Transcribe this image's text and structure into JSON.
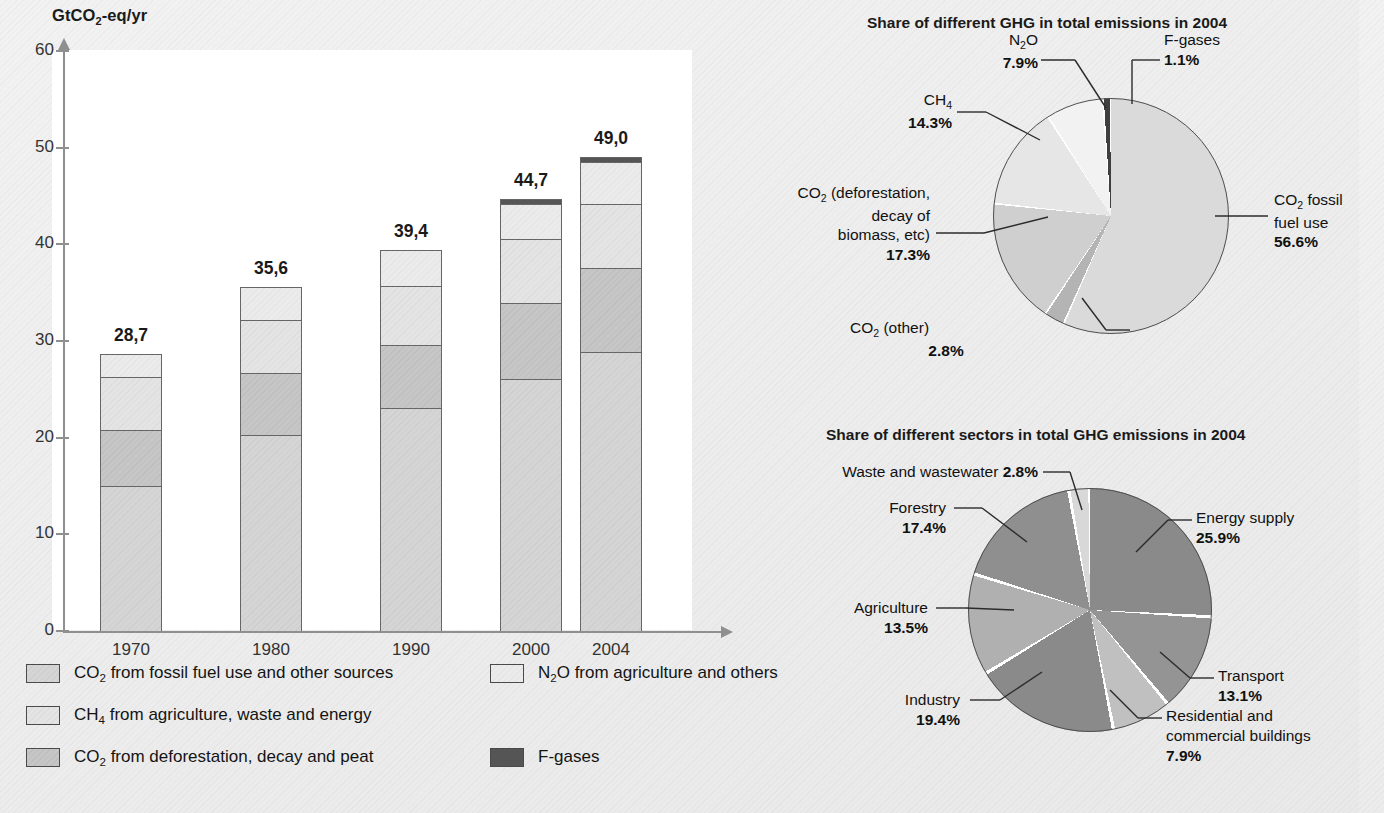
{
  "bar_chart": {
    "y_axis_title": "GtCO2-eq/yr",
    "y_ticks": [
      "0",
      "10",
      "20",
      "30",
      "40",
      "50",
      "60"
    ],
    "x_labels": [
      "1970",
      "1980",
      "1990",
      "2000",
      "2004"
    ],
    "totals": [
      "28,7",
      "35,6",
      "39,4",
      "44,7",
      "49,0"
    ],
    "legend": [
      {
        "label": "CO2 from fossil fuel use and other sources",
        "swatch": "sw-co2fossil",
        "color": "#d5d5d5"
      },
      {
        "label": "CH4 from agriculture, waste and energy",
        "swatch": "sw-ch4",
        "color": "#e4e4e4"
      },
      {
        "label": "CO2 from deforestation, decay and peat",
        "swatch": "sw-co2def",
        "color": "#c6c6c6"
      },
      {
        "label": "N2O from agriculture and others",
        "swatch": "sw-n2o",
        "color": "#ebebeb"
      },
      {
        "label": "F-gases",
        "swatch": "sw-fgas",
        "color": "#555555"
      }
    ]
  },
  "pie1": {
    "title": "Share of different GHG in total emissions in 2004",
    "labels": {
      "n2o": {
        "name": "N2O",
        "value": "7.9%"
      },
      "fgases": {
        "name": "F-gases",
        "value": "1.1%"
      },
      "ch4": {
        "name": "CH4",
        "value": "14.3%"
      },
      "co2_defor_l1": "CO2 (deforestation,",
      "co2_defor_l2": "decay of",
      "co2_defor_l3": "biomass, etc)",
      "co2_defor_value": "17.3%",
      "co2_other": {
        "name": "CO2 (other)",
        "value": "2.8%"
      },
      "co2_fossil_l1": "CO2 fossil",
      "co2_fossil_l2": "fuel use",
      "co2_fossil_value": "56.6%"
    }
  },
  "pie2": {
    "title": "Share of different sectors in total GHG emissions in 2004",
    "labels": {
      "waste": {
        "name": "Waste and wastewater",
        "value": "2.8%"
      },
      "forestry": {
        "name": "Forestry",
        "value": "17.4%"
      },
      "agriculture": {
        "name": "Agriculture",
        "value": "13.5%"
      },
      "industry": {
        "name": "Industry",
        "value": "19.4%"
      },
      "residential_l1": "Residential and",
      "residential_l2": "commercial buildings",
      "residential_value": "7.9%",
      "transport": {
        "name": "Transport",
        "value": "13.1%"
      },
      "energy": {
        "name": "Energy supply",
        "value": "25.9%"
      }
    }
  },
  "chart_data": [
    {
      "type": "bar",
      "title": "",
      "xlabel": "",
      "ylabel": "GtCO2-eq/yr",
      "ylim": [
        0,
        60
      ],
      "grid": false,
      "stacked": true,
      "categories": [
        "1970",
        "1980",
        "1990",
        "2000",
        "2004"
      ],
      "totals": [
        28.7,
        35.6,
        39.4,
        44.7,
        49.0
      ],
      "series": [
        {
          "name": "CO2 from fossil fuel use and other sources",
          "values": [
            15.0,
            20.3,
            23.1,
            26.1,
            28.9
          ],
          "color": "#d5d5d5"
        },
        {
          "name": "CO2 from deforestation, decay and peat",
          "values": [
            5.8,
            6.4,
            6.5,
            7.8,
            8.7
          ],
          "color": "#c6c6c6"
        },
        {
          "name": "CH4 from agriculture, waste and energy",
          "values": [
            5.5,
            5.5,
            6.1,
            6.7,
            6.6
          ],
          "color": "#e4e4e4"
        },
        {
          "name": "N2O from agriculture and others",
          "values": [
            2.4,
            3.4,
            3.7,
            3.6,
            4.3
          ],
          "color": "#ebebeb"
        },
        {
          "name": "F-gases",
          "values": [
            0.0,
            0.0,
            0.0,
            0.5,
            0.5
          ],
          "color": "#555555"
        }
      ]
    },
    {
      "type": "pie",
      "title": "Share of different GHG in total emissions in 2004",
      "legend_position": "callout-labels",
      "labels": [
        "CO2 fossil fuel use",
        "CO2 (other)",
        "CO2 (deforestation, decay of biomass, etc)",
        "CH4",
        "N2O",
        "F-gases"
      ],
      "values": [
        56.6,
        2.8,
        17.3,
        14.3,
        7.9,
        1.1
      ],
      "colors": [
        "#dadada",
        "#b4b4b4",
        "#cfcfcf",
        "#e6e6e6",
        "#f2f2f2",
        "#3f3f3f"
      ],
      "start_angle_deg": 0,
      "direction": "clockwise"
    },
    {
      "type": "pie",
      "title": "Share of different sectors in total GHG emissions in 2004",
      "legend_position": "callout-labels",
      "labels": [
        "Energy supply",
        "Transport",
        "Residential and commercial buildings",
        "Industry",
        "Agriculture",
        "Forestry",
        "Waste and wastewater"
      ],
      "values": [
        25.9,
        13.1,
        7.9,
        19.4,
        13.5,
        17.4,
        2.8
      ],
      "colors": [
        "#8a8a8a",
        "#949494",
        "#c0c0c0",
        "#8a8a8a",
        "#b0b0b0",
        "#8f8f8f",
        "#d8d8d8"
      ],
      "start_angle_deg": 0,
      "direction": "clockwise"
    }
  ]
}
